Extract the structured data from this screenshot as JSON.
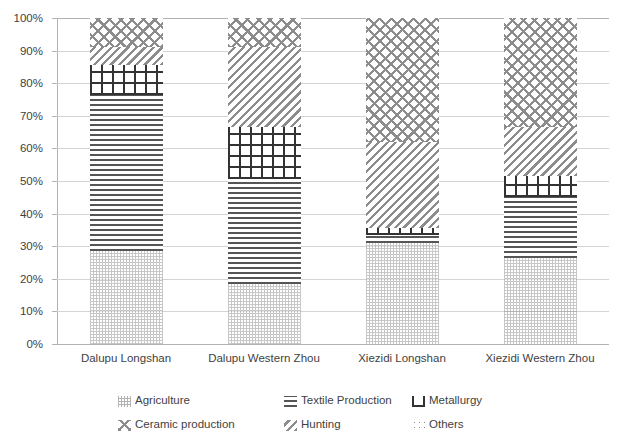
{
  "chart_data": {
    "type": "bar",
    "subtype": "stacked-100-percent",
    "title": "",
    "xlabel": "",
    "ylabel": "",
    "ylim": [
      0,
      100
    ],
    "yunit": "%",
    "grid": true,
    "legend_position": "bottom",
    "categories": [
      "Dalupu Longshan",
      "Dalupu Western Zhou",
      "Xiezidi Longshan",
      "Xiezidi Western Zhou"
    ],
    "ytick_labels": [
      "0%",
      "10%",
      "20%",
      "30%",
      "40%",
      "50%",
      "60%",
      "70%",
      "80%",
      "90%",
      "100%"
    ],
    "ytick_values": [
      0,
      10,
      20,
      30,
      40,
      50,
      60,
      70,
      80,
      90,
      100
    ],
    "series": [
      {
        "name": "Agriculture",
        "pattern": "dotted-stipple",
        "values": [
          28.5,
          18.5,
          31.0,
          26.5
        ]
      },
      {
        "name": "Textile Production",
        "pattern": "horizontal-lines",
        "values": [
          48.0,
          32.0,
          2.5,
          18.5
        ]
      },
      {
        "name": "Metallurgy",
        "pattern": "cross-grid",
        "values": [
          9.0,
          16.0,
          2.0,
          6.5
        ]
      },
      {
        "name": "Hunting",
        "pattern": "diagonal-hatch",
        "values": [
          5.5,
          24.5,
          26.5,
          15.0
        ]
      },
      {
        "name": "Ceramic production",
        "pattern": "diagonal-cross-hatch",
        "values": [
          9.0,
          9.0,
          38.0,
          33.5
        ]
      },
      {
        "name": "Others",
        "pattern": "sparse-dots",
        "values": [
          0,
          0,
          0,
          0
        ]
      }
    ]
  },
  "legend": {
    "entries": [
      {
        "label": "Agriculture",
        "swatch": "pat-agriculture"
      },
      {
        "label": "Textile Production",
        "swatch": "pat-textile"
      },
      {
        "label": "Metallurgy",
        "swatch": "pat-metallurgy"
      },
      {
        "label": "Ceramic production",
        "swatch": "pat-ceramic"
      },
      {
        "label": "Hunting",
        "swatch": "pat-hunting"
      },
      {
        "label": "Others",
        "swatch": "pat-others"
      }
    ]
  },
  "colors": {
    "background": "#ffffff",
    "gridline": "#d4d4d4",
    "axis": "#b3b3b3",
    "text": "#3f3f3f",
    "hatch_dark": "#333333",
    "hatch_mid": "#8c8c8c"
  }
}
